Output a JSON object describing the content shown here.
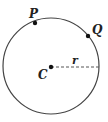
{
  "diagram": {
    "type": "circle",
    "center": {
      "label": "C",
      "x": 51,
      "y": 66
    },
    "radius": {
      "label": "r",
      "value_px": 48
    },
    "points": [
      {
        "label": "P",
        "x": 35,
        "y": 23
      },
      {
        "label": "Q",
        "x": 88,
        "y": 36
      }
    ],
    "colors": {
      "stroke": "#444444",
      "dash": "#555555",
      "point": "#111111"
    }
  }
}
